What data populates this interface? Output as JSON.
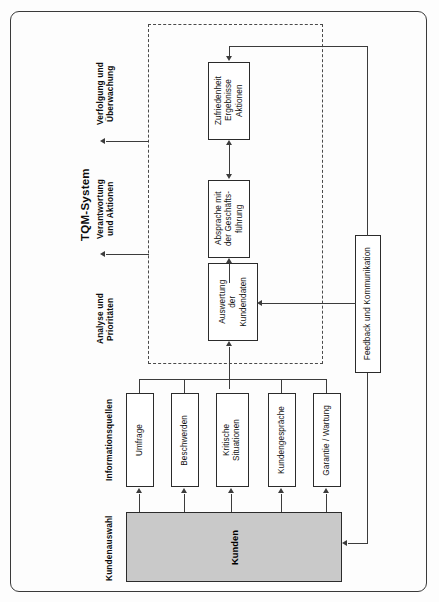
{
  "diagram": {
    "title": "TQM-System",
    "stage_captions": [
      {
        "id": "verfolgung",
        "label": "Verfolgung und\nÜberwachung"
      },
      {
        "id": "verantwortung",
        "label": "Verantwortung\nund Aktionen"
      },
      {
        "id": "analyse",
        "label": "Analyse und\nPrioritäten"
      },
      {
        "id": "informationsquellen",
        "label": "Informationsquellen"
      },
      {
        "id": "kundenauswahl",
        "label": "Kundenauswahl"
      }
    ],
    "process_boxes": [
      {
        "id": "zufriedenheit",
        "label": "Zufriedenheit\nErgebnisse\nAktionen"
      },
      {
        "id": "absprache",
        "label": "Absprache mit\nder Geschäfts-\nführung"
      },
      {
        "id": "auswertung",
        "label": "Auswertung\nder\nKundendaten"
      }
    ],
    "feedback_box": {
      "id": "feedback",
      "label": "Feedback und Kommunikation"
    },
    "sources": [
      {
        "id": "umfrage",
        "label": "Umfrage"
      },
      {
        "id": "beschwerden",
        "label": "Beschwerden"
      },
      {
        "id": "kritische",
        "label": "Kritische\nSituationen"
      },
      {
        "id": "kundengespraeche",
        "label": "Kundengespräche"
      },
      {
        "id": "garantie",
        "label": "Garantie / Wartung"
      }
    ],
    "customer_box": {
      "id": "kunden",
      "label": "Kunden"
    },
    "colors": {
      "customer_fill": "#c9c9c9",
      "box_fill": "#ffffff",
      "line": "#3c3c3c",
      "frame": "#3a3a3a",
      "dashed_boundary": "#4a4a4a"
    }
  }
}
